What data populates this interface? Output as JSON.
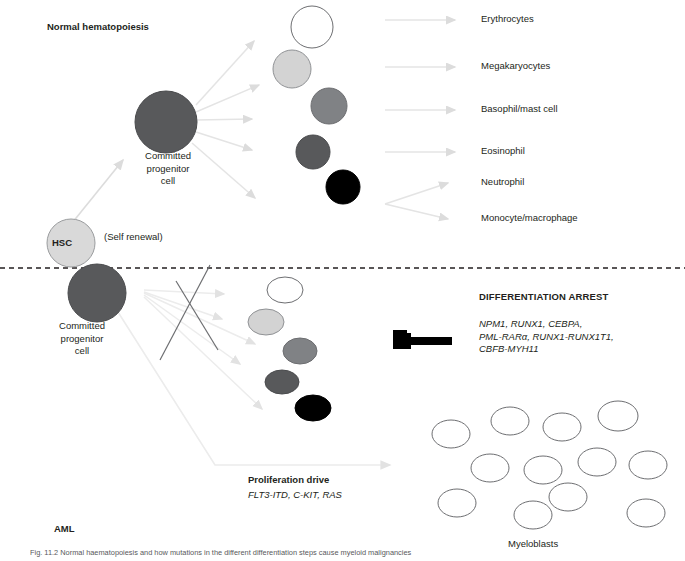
{
  "figure": {
    "sections": {
      "top_title": "Normal hematopoiesis",
      "bottom_title": "AML"
    },
    "cells": {
      "hsc_label": "HSC",
      "self_renewal_label": "(Self renewal)",
      "committed_progenitor_top": "Committed\nprogenitor\ncell",
      "committed_progenitor_bottom": "Committed\nprogenitor\ncell",
      "myeloblasts_label": "Myeloblasts"
    },
    "lineage_labels": [
      "Erythrocytes",
      "Megakaryocytes",
      "Basophil/mast cell",
      "Eosinophil",
      "Neutrophil",
      "Monocyte/macrophage"
    ],
    "differentiation_arrest": {
      "title": "DIFFERENTIATION ARREST",
      "genes": "NPM1, RUNX1, CEBPA,\nPML-RARα, RUNX1-RUNX1T1,\nCBFB-MYH11"
    },
    "proliferation": {
      "title": "Proliferation drive",
      "genes": "FLT3-ITD, C-KIT, RAS"
    },
    "caption": "Fig. 11.2 Normal haematopoiesis and how mutations in the different differentiation steps cause myeloid malignancies",
    "colors": {
      "erythrocyte": "#ffffff",
      "megakaryocyte": "#d3d3d3",
      "basophil": "#808285",
      "eosinophil": "#58595b",
      "neutrophil": "#000000",
      "hsc": "#d9d9d9",
      "progenitor": "#58595b",
      "arrow": "#e6e6e6",
      "cross_line": "#6d6e71",
      "divider": "#231f20",
      "text": "#231f20"
    }
  },
  "geometry": {
    "top_cells": [
      {
        "name": "erythrocyte",
        "cx": 312,
        "cy": 27,
        "r": 21,
        "fill": "#ffffff",
        "stroke": "#6d6e71"
      },
      {
        "name": "megakaryocyte",
        "cx": 292,
        "cy": 69,
        "r": 19,
        "fill": "#d3d3d3",
        "stroke": "#808285"
      },
      {
        "name": "basophil",
        "cx": 329,
        "cy": 106,
        "r": 18,
        "fill": "#808285",
        "stroke": "#6d6e71"
      },
      {
        "name": "eosinophil",
        "cx": 313,
        "cy": 152,
        "r": 17,
        "fill": "#58595b",
        "stroke": "#4a4b4d"
      },
      {
        "name": "neutrophil",
        "cx": 343,
        "cy": 187,
        "r": 17,
        "fill": "#000000",
        "stroke": "#000000"
      }
    ],
    "bottom_cells": [
      {
        "name": "blast-white",
        "cx": 285,
        "cy": 290,
        "rx": 18,
        "ry": 13,
        "fill": "#ffffff",
        "stroke": "#6d6e71"
      },
      {
        "name": "blast-light",
        "cx": 266,
        "cy": 322,
        "rx": 18,
        "ry": 13,
        "fill": "#d3d3d3",
        "stroke": "#808285"
      },
      {
        "name": "blast-mid",
        "cx": 300,
        "cy": 351,
        "rx": 17,
        "ry": 13,
        "fill": "#808285",
        "stroke": "#6d6e71"
      },
      {
        "name": "blast-dark",
        "cx": 282,
        "cy": 382,
        "rx": 17,
        "ry": 12,
        "fill": "#58595b",
        "stroke": "#4a4b4d"
      },
      {
        "name": "blast-black",
        "cx": 313,
        "cy": 408,
        "rx": 18,
        "ry": 13,
        "fill": "#000000",
        "stroke": "#000000"
      }
    ],
    "myeloblasts": [
      {
        "cx": 451,
        "cy": 434,
        "rx": 19,
        "ry": 14
      },
      {
        "cx": 510,
        "cy": 421,
        "rx": 19,
        "ry": 14
      },
      {
        "cx": 562,
        "cy": 427,
        "rx": 19,
        "ry": 14
      },
      {
        "cx": 618,
        "cy": 416,
        "rx": 20,
        "ry": 15
      },
      {
        "cx": 490,
        "cy": 468,
        "rx": 19,
        "ry": 14
      },
      {
        "cx": 543,
        "cy": 470,
        "rx": 19,
        "ry": 14
      },
      {
        "cx": 597,
        "cy": 462,
        "rx": 19,
        "ry": 14
      },
      {
        "cx": 648,
        "cy": 465,
        "rx": 19,
        "ry": 14
      },
      {
        "cx": 457,
        "cy": 503,
        "rx": 19,
        "ry": 14
      },
      {
        "cx": 533,
        "cy": 515,
        "rx": 19,
        "ry": 14
      },
      {
        "cx": 568,
        "cy": 497,
        "rx": 19,
        "ry": 14
      },
      {
        "cx": 646,
        "cy": 513,
        "rx": 19,
        "ry": 14
      }
    ]
  }
}
